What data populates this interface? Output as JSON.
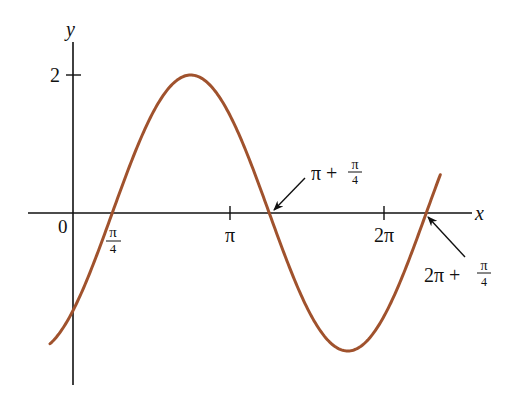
{
  "chart_data": {
    "type": "line",
    "title": "",
    "function": "y = 2 sin(x - π/4)",
    "xlabel": "x",
    "ylabel": "y",
    "origin_label": "0",
    "x_ticks": [
      {
        "value": 0.7854,
        "label_num": "π",
        "label_den": "4"
      },
      {
        "value": 3.1416,
        "label": "π"
      },
      {
        "value": 6.2832,
        "label": "2π"
      }
    ],
    "y_ticks": [
      {
        "value": 2,
        "label": "2"
      }
    ],
    "xlim": [
      -0.9,
      7.97
    ],
    "ylim": [
      -3.47,
      3.45
    ],
    "grid": false,
    "legend": null,
    "series": [
      {
        "name": "2 sin(x - π/4)",
        "color": "#a0522d",
        "x_range": [
          -0.46,
          7.35
        ],
        "amplitude": 2,
        "phase_shift": 0.7854,
        "period": 6.2832
      }
    ],
    "annotations": [
      {
        "text_main": "π +",
        "frac_num": "π",
        "frac_den": "4",
        "points_to_x": 3.927,
        "points_to_y": 0
      },
      {
        "text_main": "2π +",
        "frac_num": "π",
        "frac_den": "4",
        "points_to_x": 7.0686,
        "points_to_y": 0
      }
    ],
    "key_points": {
      "zeros": [
        0.7854,
        3.927,
        7.0686
      ],
      "max": {
        "x": 2.356,
        "y": 2
      },
      "min": {
        "x": 5.498,
        "y": -2
      },
      "y_intercept": -1.414
    }
  },
  "style": {
    "curve_color": "#a0522d",
    "axis_color": "#111111"
  }
}
